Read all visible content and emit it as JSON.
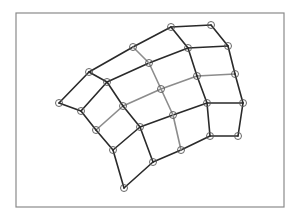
{
  "diagram": {
    "type": "structured-quad-mesh",
    "frame": {
      "x": 16,
      "y": 13,
      "width": 268,
      "height": 194,
      "stroke": "#8a8a8a"
    },
    "colors": {
      "dark_edge": "#2a2a2a",
      "light_edge": "#8c8c8c",
      "node": "#555555"
    },
    "node_radius": 3.5,
    "rows": [
      [
        [
          59,
          103
        ],
        [
          89,
          72
        ],
        [
          133,
          47
        ],
        [
          171,
          27
        ],
        [
          211,
          25
        ]
      ],
      [
        [
          81,
          111
        ],
        [
          107,
          82
        ],
        [
          149,
          63
        ],
        [
          188,
          48
        ],
        [
          228,
          46
        ]
      ],
      [
        [
          96,
          130
        ],
        [
          123,
          106
        ],
        [
          161,
          89
        ],
        [
          197,
          76
        ],
        [
          235,
          74
        ]
      ],
      [
        [
          113,
          150
        ],
        [
          140,
          127
        ],
        [
          173,
          115
        ],
        [
          207,
          103
        ],
        [
          243,
          103
        ]
      ],
      [
        [
          124,
          188
        ],
        [
          153,
          162
        ],
        [
          181,
          150
        ],
        [
          210,
          136
        ],
        [
          238,
          136
        ]
      ]
    ],
    "light_row_index": 2,
    "light_col_index": 2
  }
}
